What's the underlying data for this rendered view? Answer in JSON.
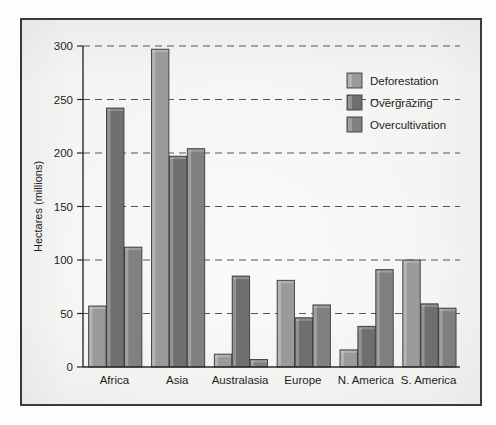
{
  "chart_data": {
    "type": "bar",
    "title": "",
    "xlabel": "",
    "ylabel": "Hectares (millions)",
    "categories": [
      "Africa",
      "Asia",
      "Australasia",
      "Europe",
      "N. America",
      "S. America"
    ],
    "series": [
      {
        "name": "Deforestation",
        "color": "#9a9a9a",
        "values": [
          57,
          297,
          12,
          81,
          16,
          100
        ]
      },
      {
        "name": "Overgrazing",
        "color": "#6f6f6f",
        "values": [
          242,
          197,
          85,
          46,
          38,
          59
        ]
      },
      {
        "name": "Overcultivation",
        "color": "#808080",
        "values": [
          112,
          204,
          7,
          58,
          91,
          55
        ]
      }
    ],
    "ylim": [
      0,
      300
    ],
    "yticks": [
      0,
      50,
      100,
      150,
      200,
      250,
      300
    ],
    "ytick_labels": [
      "0",
      "50",
      "100",
      "150",
      "200",
      "250",
      "300"
    ],
    "grid": "horizontal-dashed",
    "legend_position": "top-right",
    "legend_entries": [
      "Deforestation",
      "Overgrazing",
      "Overcultivation"
    ],
    "axis_color": "#2b2b2b",
    "grid_color": "#555555",
    "background_color": "#f4f4f2",
    "frame_color": "#3a3a3a"
  }
}
